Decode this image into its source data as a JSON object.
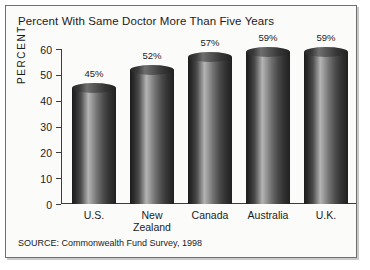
{
  "figure": {
    "title": "Percent With Same Doctor More Than Five Years",
    "source": "SOURCE: Commonwealth Fund Survey, 1998"
  },
  "chart_data": {
    "type": "bar",
    "title": "Percent With Same Doctor More Than Five Years",
    "xlabel": "",
    "ylabel": "PERCENT",
    "categories": [
      "U.S.",
      "New Zealand",
      "Canada",
      "Australia",
      "U.K."
    ],
    "values": [
      45,
      52,
      57,
      59,
      59
    ],
    "data_labels": [
      "45%",
      "52%",
      "57%",
      "59%",
      "59%"
    ],
    "ylim": [
      0,
      60
    ],
    "yticks": [
      0,
      10,
      20,
      30,
      40,
      50,
      60
    ],
    "ytick_labels": [
      "0",
      "10",
      "20",
      "30",
      "40",
      "50",
      "60"
    ],
    "grid": false,
    "legend": null,
    "style": "3d-cylinder",
    "series": [
      {
        "name": "Percent with same doctor more than five years",
        "values": [
          45,
          52,
          57,
          59,
          59
        ]
      }
    ],
    "annotations": [
      "SOURCE: Commonwealth Fund Survey, 1998"
    ],
    "colors": {
      "bar_dark": "#1c1c1c",
      "bar_highlight": "#b4b4b4",
      "axis": "#3d3d3d",
      "text": "#1b1b1b",
      "background": "#fbfbfa",
      "border": "#6e6e6e"
    }
  }
}
